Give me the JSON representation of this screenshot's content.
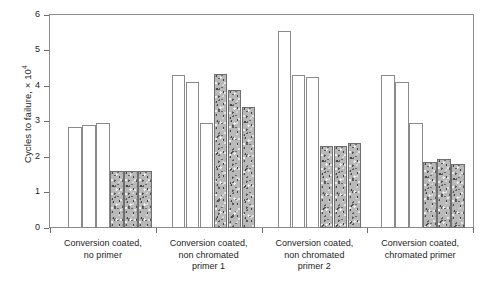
{
  "chart_data": {
    "type": "bar",
    "title": "",
    "xlabel": "",
    "ylabel": "Cycles to failure, × 10",
    "ylabel_exponent": "4",
    "ylim": [
      0,
      6
    ],
    "yticks": [
      0,
      1,
      2,
      3,
      4,
      5,
      6
    ],
    "ytick_labels": [
      "0",
      "1",
      "2",
      "3",
      "4",
      "5",
      "6"
    ],
    "grid": false,
    "legend": "none",
    "categories": [
      "Conversion coated, no primer",
      "Conversion coated, non chromated primer 1",
      "Conversion coated, non chromated primer 2",
      "Conversion coated, chromated primer"
    ],
    "category_lines": [
      [
        "Conversion coated,",
        "no primer"
      ],
      [
        "Conversion coated,",
        "non chromated",
        "primer 1"
      ],
      [
        "Conversion coated,",
        "non chromated",
        "primer 2"
      ],
      [
        "Conversion coated,",
        "chromated primer"
      ]
    ],
    "series": [
      {
        "name": "unexposed",
        "style": "white",
        "fill": "#ffffff",
        "values": [
          [
            2.85,
            2.9,
            2.95
          ],
          [
            4.3,
            4.1,
            2.95
          ],
          [
            5.55,
            4.3,
            4.25
          ],
          [
            4.3,
            4.1,
            2.95
          ]
        ]
      },
      {
        "name": "exposed",
        "style": "textured",
        "fill": "#b9b9b9",
        "values": [
          [
            1.6,
            1.6,
            1.6
          ],
          [
            4.35,
            3.9,
            3.4
          ],
          [
            2.3,
            2.3,
            2.4
          ],
          [
            1.85,
            1.95,
            1.8
          ]
        ]
      }
    ]
  }
}
